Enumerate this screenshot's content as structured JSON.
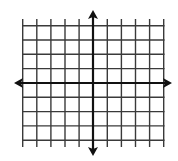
{
  "diagram": {
    "type": "coordinate-plane",
    "colors": {
      "background": "#ffffff",
      "grid": "#3a3a3a",
      "axis": "#111111"
    },
    "grid": {
      "vertical_lines_x": [
        22.7,
        36.8,
        50.9,
        65.0,
        79.1,
        107.3,
        121.4,
        135.5,
        149.6,
        163.7
      ],
      "horizontal_lines_y": [
        25.7,
        40.0,
        54.3,
        68.6,
        97.3,
        111.6,
        125.9,
        140.2
      ],
      "x_extent": [
        22,
        164.5
      ],
      "y_extent": [
        19,
        147
      ],
      "columns": 10,
      "rows": 8
    },
    "x_axis": {
      "y": 83,
      "x_start": 14,
      "x_end": 172,
      "arrows": [
        "left",
        "right"
      ]
    },
    "y_axis": {
      "x": 93,
      "y_start": 10,
      "y_end": 156,
      "arrows": [
        "up",
        "down"
      ]
    }
  }
}
